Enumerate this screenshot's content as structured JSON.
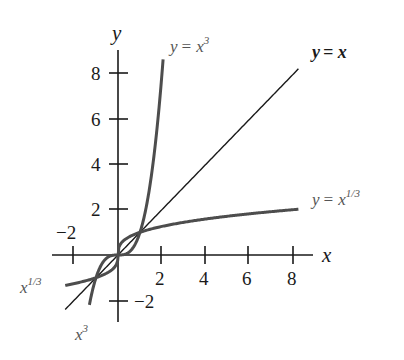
{
  "chart_data": {
    "type": "line",
    "title": "",
    "xlabel": "x",
    "ylabel": "y",
    "xlim": [
      -3,
      9
    ],
    "ylim": [
      -3,
      9
    ],
    "grid": false,
    "x_ticks": [
      -2,
      2,
      4,
      6,
      8
    ],
    "y_ticks": [
      -2,
      2,
      4,
      6,
      8
    ],
    "series": [
      {
        "name": "y = x",
        "function": "x",
        "x_range": [
          -2.4,
          8.2
        ],
        "color": "#1a1a1a"
      },
      {
        "name": "y = x^3",
        "function": "x^3",
        "x_range": [
          -1.3,
          2.05
        ],
        "color": "#4d4d4d"
      },
      {
        "name": "y = x^(1/3)",
        "function": "cbrt(x)",
        "x_range": [
          -2.4,
          8.2
        ],
        "color": "#4d4d4d"
      }
    ],
    "annotations": [
      {
        "text": "y = x^3",
        "position": "top, near steep curve"
      },
      {
        "text": "y = x",
        "position": "top right, end of diagonal line"
      },
      {
        "text": "y = x^1/3",
        "position": "right, end of flat curve"
      },
      {
        "text": "x^1/3",
        "position": "lower left, end of curve"
      },
      {
        "text": "x^3",
        "position": "bottom, end of curve"
      }
    ]
  },
  "labels": {
    "x_axis": "x",
    "y_axis": "y",
    "x_ticks": [
      "−2",
      "2",
      "4",
      "6",
      "8"
    ],
    "y_ticks": [
      "−2",
      "2",
      "4",
      "6",
      "8"
    ],
    "cube_full_y": "y",
    "cube_full_eq": "= x",
    "cube_full_exp": "3",
    "identity_y": "y",
    "identity_eq": "= x",
    "cbrt_full_y": "y",
    "cbrt_full_eq": "= x",
    "cbrt_full_exp": "1/3",
    "cbrt_short_base": "x",
    "cbrt_short_exp": "1/3",
    "cube_short_base": "x",
    "cube_short_exp": "3"
  }
}
